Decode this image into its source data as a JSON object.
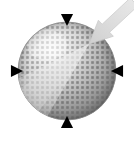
{
  "figure": {
    "name": "textured-sphere-with-incident-arrow",
    "caption": "",
    "width": 134,
    "height": 141,
    "background_color": "#ffffff"
  },
  "sphere": {
    "label": "sphere",
    "center_x": 67,
    "center_y": 71,
    "radius": 49,
    "light_direction": "upper-left",
    "highlight_color": "#f2f2f2",
    "midtone_color": "#b4b4b4",
    "shadow_color": "#6e6e6e",
    "edge_color": "#8a8a8a",
    "texture": {
      "type": "square-dot-grid",
      "dot_color": "#6b6b6b",
      "dot_size_px": 2.6,
      "spacing_px": 5.0,
      "rotation_deg": 0
    }
  },
  "markers": [
    {
      "name": "marker-top",
      "direction": "down",
      "x": 67,
      "y": 20,
      "size": 11,
      "color": "#000000"
    },
    {
      "name": "marker-bottom",
      "direction": "up",
      "x": 67,
      "y": 122,
      "size": 11,
      "color": "#000000"
    },
    {
      "name": "marker-left",
      "direction": "right",
      "x": 17,
      "y": 71,
      "size": 11,
      "color": "#000000"
    },
    {
      "name": "marker-right",
      "direction": "left",
      "x": 117,
      "y": 71,
      "size": 11,
      "color": "#000000"
    }
  ],
  "arrow": {
    "name": "incident-arrow",
    "label": "",
    "tip_x": 89,
    "tip_y": 44,
    "tail_x": 134,
    "tail_y": 2,
    "fill_color": "#dcdcdc",
    "edge_color": "#c8c8c8",
    "head_width": 22,
    "shaft_width": 11
  },
  "beam": {
    "name": "incident-beam-cone",
    "fill_color": "#e6e6e6",
    "opacity": 0.72,
    "apex_x": 89,
    "apex_y": 44,
    "spread_deg": 34
  }
}
